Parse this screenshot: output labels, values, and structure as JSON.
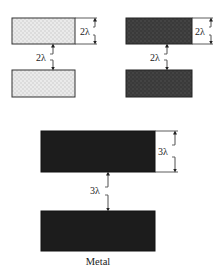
{
  "diagram": {
    "panels": [
      {
        "id": "left-layer",
        "fill": "light-stipple",
        "width_label": "2λ",
        "spacing_label": "2λ",
        "colors": {
          "fill": "#dcdcdc",
          "stipple": "#f2f2f2",
          "border": "#333333"
        }
      },
      {
        "id": "right-layer",
        "fill": "dark-stipple",
        "width_label": "2λ",
        "spacing_label": "2λ",
        "colors": {
          "fill": "#3c3c3c",
          "stipple": "#555555",
          "border": "#222222"
        }
      },
      {
        "id": "metal-layer",
        "fill": "solid-dark",
        "width_label": "3λ",
        "spacing_label": "3λ",
        "caption": "Metal",
        "colors": {
          "fill": "#1c1c1c",
          "border": "#111111"
        }
      }
    ]
  }
}
